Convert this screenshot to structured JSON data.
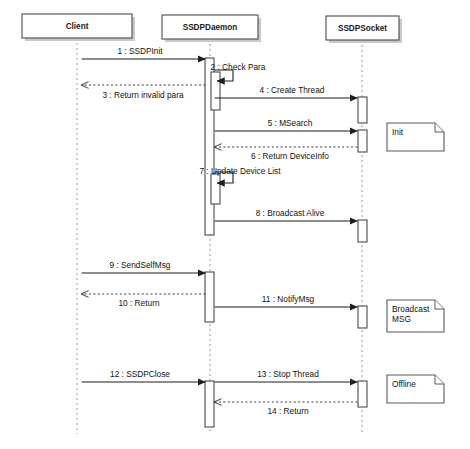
{
  "diagram": {
    "type": "uml-sequence-diagram",
    "background_color": "#ffffff",
    "line_color": "#1f1f1f",
    "box_stroke_color": "#4a4a4a",
    "lifeline_dash_color": "#9a9a9a"
  },
  "participants": [
    {
      "id": "client",
      "label": "Client",
      "x": 77,
      "box": {
        "x": 22,
        "y": 14,
        "w": 110,
        "h": 24
      }
    },
    {
      "id": "ssdpdaemon",
      "label": "SSDPDaemon",
      "x": 210,
      "box": {
        "x": 162,
        "y": 15,
        "w": 96,
        "h": 24
      }
    },
    {
      "id": "ssdpsocket",
      "label": "SSDPSocket",
      "x": 362,
      "box": {
        "x": 326,
        "y": 16,
        "w": 73,
        "h": 24
      }
    }
  ],
  "messages": [
    {
      "seq": "1",
      "label": "1 : SSDPInit",
      "from": "client",
      "to": "ssdpdaemon",
      "y": 59,
      "style": "solid",
      "direction": "right",
      "label_x": 140,
      "label_y": 54
    },
    {
      "seq": "2",
      "label": "2 : Check Para",
      "from": "ssdpdaemon",
      "to": "ssdpdaemon",
      "y": 70,
      "style": "self",
      "direction": "self",
      "label_x": 238,
      "label_y": 70
    },
    {
      "seq": "3",
      "label": "3 : Return invalid para",
      "from": "ssdpdaemon",
      "to": "client",
      "y": 85,
      "style": "dashed",
      "direction": "left",
      "label_x": 143,
      "label_y": 98
    },
    {
      "seq": "4",
      "label": "4 : Create Thread",
      "from": "ssdpdaemon",
      "to": "ssdpsocket",
      "y": 98,
      "style": "solid",
      "direction": "right",
      "label_x": 292,
      "label_y": 93
    },
    {
      "seq": "5",
      "label": "5 : MSearch",
      "from": "ssdpdaemon",
      "to": "ssdpsocket",
      "y": 131,
      "style": "solid",
      "direction": "right",
      "label_x": 290,
      "label_y": 126
    },
    {
      "seq": "6",
      "label": "6 : Return DeviceInfo",
      "from": "ssdpsocket",
      "to": "ssdpdaemon",
      "y": 147,
      "style": "dashed",
      "direction": "left",
      "label_x": 290,
      "label_y": 159
    },
    {
      "seq": "7",
      "label": "7 : Update Device List",
      "from": "ssdpdaemon",
      "to": "ssdpdaemon",
      "y": 172,
      "style": "self",
      "direction": "self",
      "label_x": 240,
      "label_y": 174
    },
    {
      "seq": "8",
      "label": "8 : Broadcast Alive",
      "from": "ssdpdaemon",
      "to": "ssdpsocket",
      "y": 221,
      "style": "solid",
      "direction": "right",
      "label_x": 290,
      "label_y": 216
    },
    {
      "seq": "9",
      "label": "9 : SendSelfMsg",
      "from": "client",
      "to": "ssdpdaemon",
      "y": 273,
      "style": "solid",
      "direction": "right",
      "label_x": 140,
      "label_y": 268
    },
    {
      "seq": "10",
      "label": "10 : Return",
      "from": "ssdpdaemon",
      "to": "client",
      "y": 294,
      "style": "dashed",
      "direction": "left",
      "label_x": 139,
      "label_y": 306
    },
    {
      "seq": "11",
      "label": "11 : NotifyMsg",
      "from": "ssdpdaemon",
      "to": "ssdpsocket",
      "y": 307,
      "style": "solid",
      "direction": "right",
      "label_x": 288,
      "label_y": 302
    },
    {
      "seq": "12",
      "label": "12 : SSDPClose",
      "from": "client",
      "to": "ssdpdaemon",
      "y": 382,
      "style": "solid",
      "direction": "right",
      "label_x": 140,
      "label_y": 377
    },
    {
      "seq": "13",
      "label": "13 : Stop Thread",
      "from": "ssdpdaemon",
      "to": "ssdpsocket",
      "y": 382,
      "style": "solid",
      "direction": "right",
      "label_x": 288,
      "label_y": 377
    },
    {
      "seq": "14",
      "label": "14 : Return",
      "from": "ssdpsocket",
      "to": "ssdpdaemon",
      "y": 402,
      "style": "dashed",
      "direction": "left",
      "label_x": 288,
      "label_y": 414
    }
  ],
  "activations": [
    {
      "id": "daemon-main",
      "participant": "ssdpdaemon",
      "x": 205,
      "y": 58,
      "w": 9,
      "h": 177
    },
    {
      "id": "daemon-check",
      "participant": "ssdpdaemon",
      "x": 211,
      "y": 72,
      "w": 9,
      "h": 38
    },
    {
      "id": "daemon-update",
      "participant": "ssdpdaemon",
      "x": 211,
      "y": 174,
      "w": 9,
      "h": 30
    },
    {
      "id": "daemon-notify",
      "participant": "ssdpdaemon",
      "x": 205,
      "y": 272,
      "w": 9,
      "h": 50
    },
    {
      "id": "daemon-close",
      "participant": "ssdpdaemon",
      "x": 205,
      "y": 381,
      "w": 9,
      "h": 46
    },
    {
      "id": "socket-create",
      "participant": "ssdpsocket",
      "x": 358,
      "y": 97,
      "w": 9,
      "h": 26
    },
    {
      "id": "socket-msearch",
      "participant": "ssdpsocket",
      "x": 358,
      "y": 130,
      "w": 9,
      "h": 22
    },
    {
      "id": "socket-alive",
      "participant": "ssdpsocket",
      "x": 358,
      "y": 220,
      "w": 9,
      "h": 22
    },
    {
      "id": "socket-notify",
      "participant": "ssdpsocket",
      "x": 358,
      "y": 306,
      "w": 9,
      "h": 22
    },
    {
      "id": "socket-stop",
      "participant": "ssdpsocket",
      "x": 358,
      "y": 381,
      "w": 9,
      "h": 26
    }
  ],
  "notes": [
    {
      "id": "note-init",
      "lines": [
        "Init"
      ],
      "x": 387,
      "y": 123,
      "w": 57,
      "h": 28
    },
    {
      "id": "note-broadcast",
      "lines": [
        "Broadcast",
        "MSG"
      ],
      "x": 387,
      "y": 300,
      "w": 57,
      "h": 32
    },
    {
      "id": "note-offline",
      "lines": [
        "Offline"
      ],
      "x": 387,
      "y": 375,
      "w": 57,
      "h": 28
    }
  ]
}
